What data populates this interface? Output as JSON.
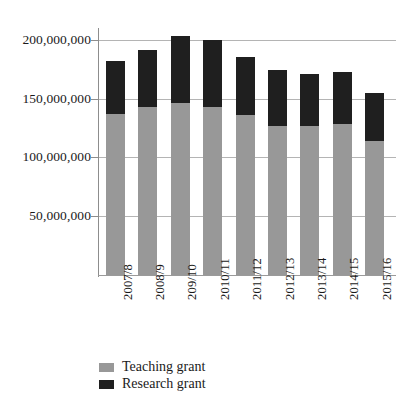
{
  "chart_data": {
    "type": "bar",
    "title": "",
    "subtitle": "",
    "xlabel": "",
    "ylabel": "",
    "stacked": true,
    "orientation": "vertical",
    "grid": true,
    "legend_position": "bottom-left",
    "ylim": [
      0,
      210000000
    ],
    "yticks": [
      50000000,
      100000000,
      150000000,
      200000000
    ],
    "ytick_labels": [
      "50,000,000",
      "100,000,000",
      "150,000,000",
      "200,000,000"
    ],
    "categories": [
      "2007/8",
      "2008/9",
      "209/10",
      "2010/11",
      "2011/12",
      "2012/13",
      "2013/14",
      "2014/15",
      "2015/16"
    ],
    "series": [
      {
        "name": "Teaching grant",
        "color": "#989898",
        "values": [
          137000000,
          143000000,
          146000000,
          143000000,
          136000000,
          127000000,
          127000000,
          128000000,
          114000000
        ]
      },
      {
        "name": "Research grant",
        "color": "#1f1f1f",
        "values": [
          45000000,
          48000000,
          57000000,
          57000000,
          49000000,
          47000000,
          44000000,
          45000000,
          41000000
        ]
      }
    ],
    "totals": [
      182000000,
      191000000,
      203000000,
      200000000,
      185000000,
      174000000,
      171000000,
      173000000,
      155000000
    ]
  },
  "legend": {
    "items": [
      {
        "label": "Teaching grant",
        "swatch": "teaching"
      },
      {
        "label": "Research grant",
        "swatch": "research"
      }
    ]
  }
}
